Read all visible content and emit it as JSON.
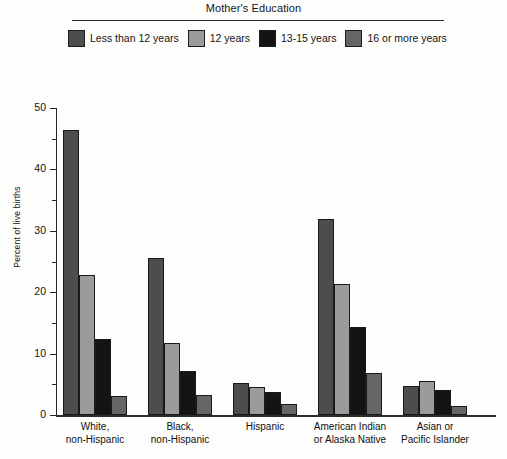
{
  "legend": {
    "title": "Mother's Education",
    "entries": [
      {
        "label": "Less than 12 years",
        "color": "#4d4d4d"
      },
      {
        "label": "12 years",
        "color": "#9b9b9b"
      },
      {
        "label": "13-15 years",
        "color": "#141414"
      },
      {
        "label": "16 or more years",
        "color": "#656565"
      }
    ]
  },
  "axes": {
    "y_title": "Percent of live births",
    "y_ticks": [
      "0",
      "10",
      "20",
      "30",
      "40",
      "50"
    ],
    "y_min": 0,
    "y_max": 50
  },
  "chart_data": {
    "type": "bar",
    "title": "Mother's Education",
    "xlabel": "",
    "ylabel": "Percent of live births",
    "ylim": [
      0,
      50
    ],
    "yticks": [
      0,
      10,
      20,
      30,
      40,
      50
    ],
    "grid": false,
    "legend_position": "top",
    "categories": [
      "White,\nnon-Hispanic",
      "Black,\nnon-Hispanic",
      "Hispanic",
      "American Indian\nor Alaska Native",
      "Asian or\nPacific Islander"
    ],
    "series": [
      {
        "name": "Less than 12 years",
        "color": "#4d4d4d",
        "values": [
          46.5,
          25.6,
          5.2,
          32.0,
          4.8
        ]
      },
      {
        "name": "12 years",
        "color": "#9b9b9b",
        "values": [
          22.8,
          11.8,
          4.6,
          21.3,
          5.5
        ]
      },
      {
        "name": "13-15 years",
        "color": "#141414",
        "values": [
          12.4,
          7.2,
          3.8,
          14.4,
          4.1
        ]
      },
      {
        "name": "16 or more years",
        "color": "#656565",
        "values": [
          3.1,
          3.2,
          1.8,
          6.8,
          1.4
        ]
      }
    ]
  }
}
